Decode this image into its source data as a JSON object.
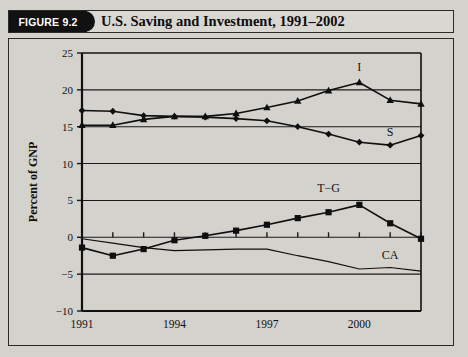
{
  "figure": {
    "tab_label": "FIGURE 9.2",
    "title": "U.S. Saving and Investment, 1991–2002"
  },
  "chart_data": {
    "type": "line",
    "title": "U.S. Saving and Investment, 1991–2002",
    "xlabel": "",
    "ylabel": "Percent of GNP",
    "ylim": [
      -10,
      25
    ],
    "yticks": [
      -10,
      -5,
      0,
      5,
      10,
      15,
      20,
      25
    ],
    "ytick_labels": [
      "−10",
      "−5",
      "0",
      "5",
      "10",
      "15",
      "20",
      "25"
    ],
    "xlim": [
      1991,
      2002
    ],
    "x": [
      1991,
      1992,
      1993,
      1994,
      1995,
      1996,
      1997,
      1998,
      1999,
      2000,
      2001,
      2002
    ],
    "xticks": [
      1991,
      1992,
      1993,
      1994,
      1995,
      1996,
      1997,
      1998,
      1999,
      2000,
      2001,
      2002
    ],
    "xtick_labels_shown": [
      "1991",
      "1994",
      "1997",
      "2000"
    ],
    "xtick_labels_shown_at": [
      1991,
      1994,
      1997,
      2000
    ],
    "grid": "horizontal",
    "legend_position": "inline-annotations",
    "series": [
      {
        "name": "S",
        "label": "S",
        "marker": "diamond",
        "label_x": 2001,
        "label_y": 13.8,
        "values": [
          17.2,
          17.1,
          16.5,
          16.4,
          16.3,
          16.1,
          15.8,
          15.0,
          14.0,
          12.9,
          12.5,
          13.8
        ]
      },
      {
        "name": "I",
        "label": "I",
        "marker": "triangle",
        "label_x": 2000,
        "label_y": 22.5,
        "values": [
          15.2,
          15.2,
          16.0,
          16.4,
          16.4,
          16.8,
          17.6,
          18.5,
          19.9,
          21.0,
          18.6,
          18.1
        ]
      },
      {
        "name": "T−G",
        "label": "T−G",
        "marker": "square",
        "label_x": 1999,
        "label_y": 6.2,
        "values": [
          -1.4,
          -2.5,
          -1.6,
          -0.4,
          0.2,
          0.9,
          1.7,
          2.6,
          3.4,
          4.4,
          1.9,
          -0.2
        ]
      },
      {
        "name": "CA",
        "label": "CA",
        "marker": "none",
        "label_x": 2001,
        "label_y": -2.9,
        "values": [
          -0.2,
          -0.8,
          -1.4,
          -1.8,
          -1.7,
          -1.6,
          -1.6,
          -2.5,
          -3.3,
          -4.3,
          -4.1,
          -4.6
        ]
      }
    ]
  }
}
